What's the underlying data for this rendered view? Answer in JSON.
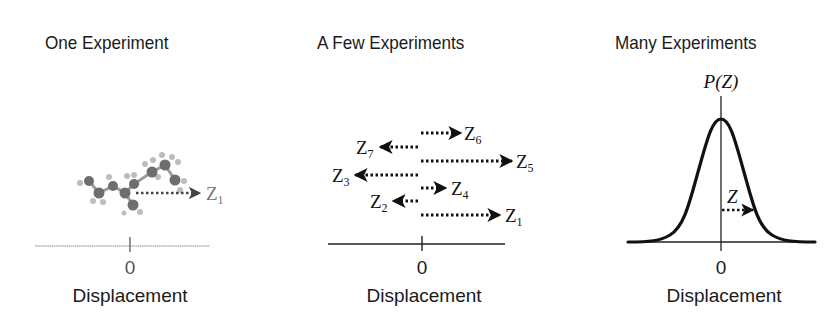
{
  "panels": [
    {
      "title": "One Experiment",
      "tick_label": "0",
      "axis_label": "Displacement",
      "arrows": [
        {
          "label": "Z",
          "subscript": "1",
          "direction": "right"
        }
      ]
    },
    {
      "title": "A Few Experiments",
      "tick_label": "0",
      "axis_label": "Displacement",
      "arrows": [
        {
          "label": "Z",
          "subscript": "6",
          "direction": "right"
        },
        {
          "label": "Z",
          "subscript": "7",
          "direction": "left"
        },
        {
          "label": "Z",
          "subscript": "5",
          "direction": "right"
        },
        {
          "label": "Z",
          "subscript": "3",
          "direction": "left"
        },
        {
          "label": "Z",
          "subscript": "4",
          "direction": "right"
        },
        {
          "label": "Z",
          "subscript": "2",
          "direction": "left"
        },
        {
          "label": "Z",
          "subscript": "1",
          "direction": "right"
        }
      ]
    },
    {
      "title": "Many Experiments",
      "tick_label": "0",
      "axis_label": "Displacement",
      "y_axis_label": "P(Z)",
      "arrows": [
        {
          "label": "Z",
          "subscript": "",
          "direction": "right"
        }
      ],
      "curve": "gaussian"
    }
  ],
  "colors": {
    "ink": "#111111",
    "molecule_carbon": "#6e6e6e",
    "molecule_hydrogen": "#b8b8b8",
    "faded_axis": "#8a8a8a"
  }
}
